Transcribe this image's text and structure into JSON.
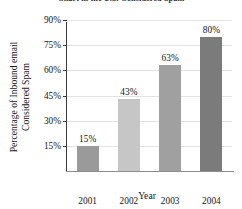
{
  "chart_data": {
    "type": "bar",
    "title": "Chart in the U.S. Considered Spam",
    "xlabel": "Year",
    "ylabel_line1": "Percentage of Inbound email",
    "ylabel_line2": "Considered Spam",
    "categories": [
      "2001",
      "2002",
      "2003",
      "2004"
    ],
    "values": [
      15,
      43,
      63,
      80
    ],
    "value_labels": [
      "15%",
      "43%",
      "63%",
      "80%"
    ],
    "ytick_labels": [
      "15%",
      "30%",
      "45%",
      "60%",
      "75%",
      "90%"
    ],
    "ytick_values": [
      15,
      30,
      45,
      60,
      75,
      90
    ],
    "ylim": [
      0,
      90
    ],
    "grid": true,
    "legend": "none",
    "bar_colors": [
      "#9a9a9a",
      "#c6c6c6",
      "#a0a0a0",
      "#7b7b7b"
    ]
  }
}
